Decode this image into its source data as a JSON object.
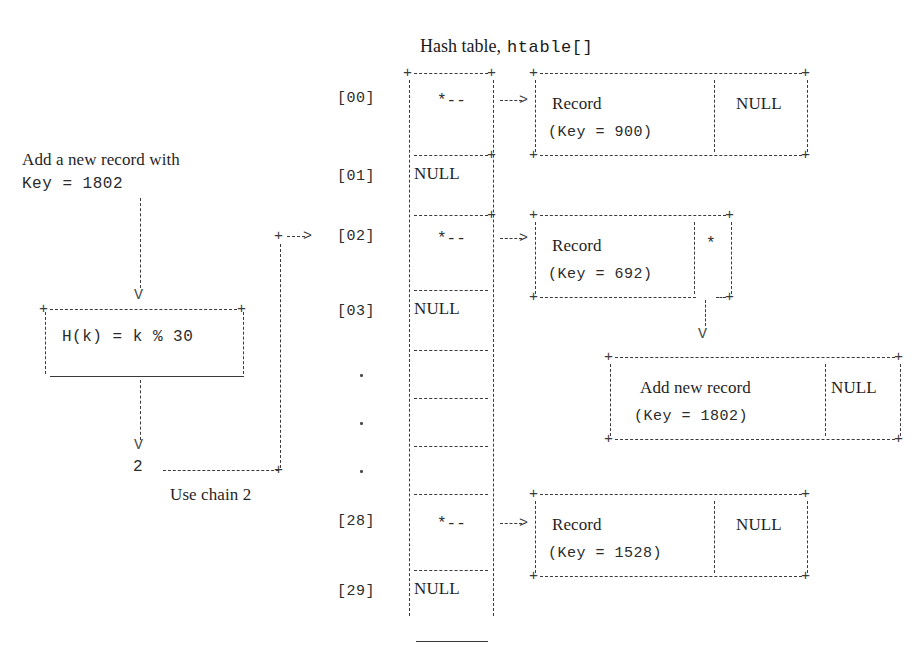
{
  "figure": {
    "title_serif": "Hash table,",
    "title_mono": "htable[]",
    "caption_use_chain": "Use chain 2"
  },
  "left_flow": {
    "intro_line1": "Add a new record with",
    "intro_line2": "Key = 1802",
    "hash_box": {
      "formula": "H(k) = k % 30"
    },
    "result_value": "2",
    "use_chain_label": "Use chain 2",
    "arrow_down_glyph": "V"
  },
  "hash_table": {
    "label": "htable[]",
    "bucket_cell_null": "NULL",
    "bucket_cell_pointer": "*--",
    "arrow_glyph": "-->",
    "ellipsis_glyph": ".",
    "rows": [
      {
        "index": "[00]",
        "cell": "*--",
        "has_record": true
      },
      {
        "index": "[01]",
        "cell": "NULL",
        "has_record": false
      },
      {
        "index": "[02]",
        "cell": "*--",
        "has_record": true
      },
      {
        "index": "[03]",
        "cell": "NULL",
        "has_record": false
      },
      {
        "index": ".",
        "cell": "",
        "has_record": false
      },
      {
        "index": ".",
        "cell": "",
        "has_record": false
      },
      {
        "index": ".",
        "cell": "",
        "has_record": false
      },
      {
        "index": "[28]",
        "cell": "*--",
        "has_record": true
      },
      {
        "index": "[29]",
        "cell": "NULL",
        "has_record": false
      }
    ]
  },
  "records": {
    "record_00": {
      "title": "Record",
      "key_line": "(Key = 900)",
      "next_pointer": "NULL"
    },
    "record_02": {
      "title": "Record",
      "key_line": "(Key = 692)",
      "next_pointer": "*"
    },
    "record_new": {
      "title": "Add new record",
      "key_line": "(Key = 1802)",
      "next_pointer": "NULL"
    },
    "record_28": {
      "title": "Record",
      "key_line": "(Key = 1528)",
      "next_pointer": "NULL"
    }
  },
  "colors": {
    "ink": "#2b2b2b",
    "rule": "#3a3a3a",
    "background": "#ffffff"
  }
}
